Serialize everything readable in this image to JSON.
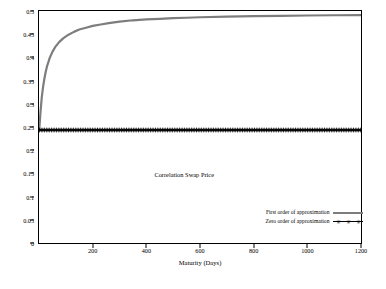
{
  "chart_data": {
    "type": "line",
    "title": "",
    "annotation": "Correlation Swap Price",
    "xlabel": "Maturity (Days)",
    "ylabel": "",
    "xlim": [
      0,
      1200
    ],
    "ylim": [
      0,
      0.5
    ],
    "xticks": [
      200,
      400,
      600,
      800,
      1000,
      1200
    ],
    "yticks": [
      0,
      0.05,
      0.1,
      0.15,
      0.2,
      0.25,
      0.3,
      0.35,
      0.4,
      0.45,
      0.5
    ],
    "ytick_labels": [
      "0",
      "0.05",
      "0.1",
      "0.15",
      "0.2",
      "0.25",
      "0.3",
      "0.35",
      "0.4",
      "0.45",
      "0.5"
    ],
    "grid": false,
    "legend_position": "bottom-right",
    "series": [
      {
        "name": "First order of approximation",
        "color": "#7d7d7d",
        "marker": "none",
        "x": [
          1,
          5,
          10,
          15,
          20,
          25,
          30,
          40,
          50,
          60,
          75,
          90,
          110,
          130,
          150,
          175,
          200,
          230,
          260,
          300,
          350,
          400,
          450,
          500,
          550,
          600,
          700,
          800,
          900,
          1000,
          1100,
          1200
        ],
        "y": [
          0.244,
          0.278,
          0.312,
          0.336,
          0.354,
          0.369,
          0.381,
          0.399,
          0.412,
          0.422,
          0.433,
          0.441,
          0.449,
          0.455,
          0.46,
          0.464,
          0.468,
          0.471,
          0.474,
          0.477,
          0.48,
          0.482,
          0.483,
          0.4845,
          0.4855,
          0.4865,
          0.488,
          0.489,
          0.4897,
          0.4903,
          0.4908,
          0.4912
        ]
      },
      {
        "name": "Zero order of approximation",
        "color": "#000000",
        "marker": "star",
        "x": [
          1,
          50,
          100,
          150,
          200,
          250,
          300,
          350,
          400,
          450,
          500,
          550,
          600,
          650,
          700,
          750,
          800,
          850,
          900,
          950,
          1000,
          1050,
          1100,
          1150,
          1200
        ],
        "y": [
          0.2435,
          0.2435,
          0.2435,
          0.2435,
          0.2435,
          0.2435,
          0.2435,
          0.2435,
          0.2435,
          0.2435,
          0.2435,
          0.2435,
          0.2435,
          0.2435,
          0.2435,
          0.2435,
          0.2435,
          0.2435,
          0.2435,
          0.2435,
          0.2435,
          0.2435,
          0.2435,
          0.2435,
          0.2435
        ]
      }
    ]
  }
}
